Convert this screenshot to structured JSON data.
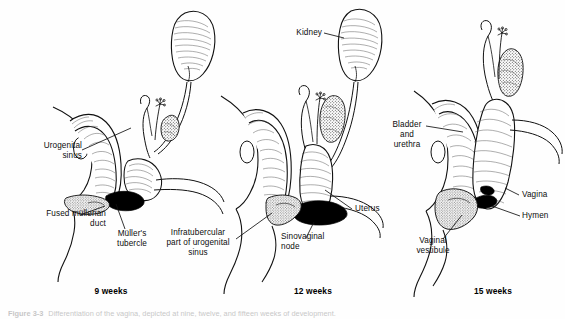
{
  "figure": {
    "background_color": "#fefefe",
    "ink_color": "#111111",
    "black_fill_color": "#000000",
    "stipple_color": "#4a4a4a"
  },
  "panels": [
    {
      "id": "panel-9-weeks",
      "stage_label": "9 weeks",
      "labels": [
        {
          "name": "urogenital-sinus",
          "text": "Urogenital\nsinus"
        },
        {
          "name": "fused-mullerian-duct",
          "text": "Fused müllerian\nduct"
        },
        {
          "name": "mullers-tubercle",
          "text": "Müller's\ntubercle"
        }
      ]
    },
    {
      "id": "panel-12-weeks",
      "stage_label": "12 weeks",
      "labels": [
        {
          "name": "kidney",
          "text": "Kidney"
        },
        {
          "name": "uterus",
          "text": "Uterus"
        },
        {
          "name": "infratubercular-part-of-urogenital-sinus",
          "text": "Infratubercular\npart of urogenital\nsinus"
        },
        {
          "name": "sinovaginal-node",
          "text": "Sinovaginal\nnode"
        }
      ]
    },
    {
      "id": "panel-15-weeks",
      "stage_label": "15 weeks",
      "labels": [
        {
          "name": "bladder-and-urethra",
          "text": "Bladder\nand\nurethra"
        },
        {
          "name": "vagina",
          "text": "Vagina"
        },
        {
          "name": "hymen",
          "text": "Hymen"
        },
        {
          "name": "vaginal-vestibule",
          "text": "Vaginal\nvestibule"
        }
      ]
    }
  ],
  "caption": {
    "number": "Figure 3-3",
    "text": "Differentiation of the vagina, depicted at nine, twelve, and fifteen weeks of development."
  }
}
